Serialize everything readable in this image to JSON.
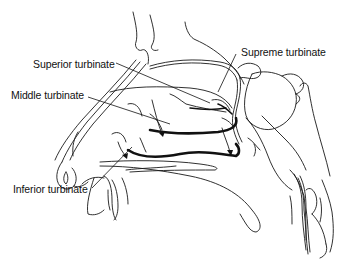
{
  "figure": {
    "labels": [
      {
        "id": "superior",
        "text": "Superior turbinate"
      },
      {
        "id": "middle",
        "text": "Middle turbinate"
      },
      {
        "id": "inferior",
        "text": "Inferior turbinate"
      },
      {
        "id": "supreme",
        "text": "Supreme turbinate"
      }
    ],
    "colors": {
      "background": "#ffffff",
      "line": "#1a1a1a"
    }
  }
}
